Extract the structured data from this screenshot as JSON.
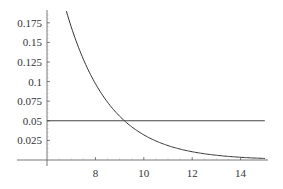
{
  "chart_data": {
    "type": "line",
    "title": "",
    "xlabel": "",
    "ylabel": "",
    "xlim": [
      6,
      15.2
    ],
    "ylim": [
      0,
      0.194
    ],
    "grid": false,
    "legend": null,
    "x_ticks": [
      "8",
      "10",
      "12",
      "14"
    ],
    "y_ticks": [
      "0.025",
      "0.05",
      "0.075",
      "0.1",
      "0.125",
      "0.15",
      "0.175"
    ],
    "x_tick_values": [
      8,
      10,
      12,
      14
    ],
    "y_tick_values": [
      0.025,
      0.05,
      0.075,
      0.1,
      0.125,
      0.15,
      0.175
    ],
    "series": [
      {
        "name": "curve",
        "x": [
          6.8,
          7,
          7.5,
          8,
          8.5,
          9,
          9.5,
          10,
          10.5,
          11,
          11.5,
          12,
          12.5,
          13,
          13.5,
          14,
          14.5,
          15
        ],
        "y": [
          0.19,
          0.17,
          0.128,
          0.097,
          0.074,
          0.056,
          0.042,
          0.032,
          0.024,
          0.018,
          0.014,
          0.0105,
          0.008,
          0.006,
          0.0045,
          0.0035,
          0.0026,
          0.002
        ]
      },
      {
        "name": "threshold",
        "x": [
          6,
          15
        ],
        "y": [
          0.05,
          0.05
        ]
      }
    ],
    "annotations": []
  },
  "colors": {
    "axis": "#555555",
    "curve": "#333333",
    "threshold": "#444444"
  }
}
